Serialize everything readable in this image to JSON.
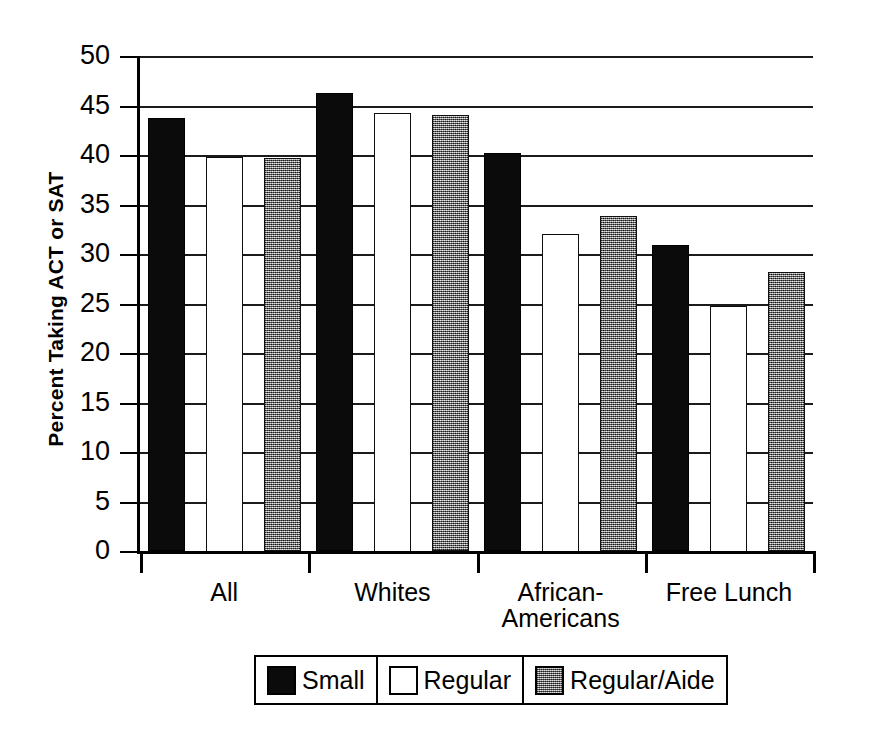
{
  "chart_data": {
    "type": "bar",
    "title": "",
    "xlabel": "",
    "ylabel": "Percent Taking ACT or SAT",
    "categories": [
      "All",
      "Whites",
      "African-Americans",
      "Free Lunch"
    ],
    "category_lines": [
      [
        "All"
      ],
      [
        "Whites"
      ],
      [
        "African-",
        "Americans"
      ],
      [
        "Free Lunch"
      ]
    ],
    "series": [
      {
        "name": "Small",
        "values": [
          43.7,
          46.3,
          40.2,
          30.9
        ]
      },
      {
        "name": "Regular",
        "values": [
          39.8,
          44.2,
          32.0,
          24.7
        ]
      },
      {
        "name": "Regular/Aide",
        "values": [
          39.7,
          44.0,
          33.8,
          28.2
        ]
      }
    ],
    "ylim": [
      0,
      50
    ],
    "ytick_values": [
      0,
      5,
      10,
      15,
      20,
      25,
      30,
      35,
      40,
      45,
      50
    ],
    "ytick_labels": [
      "0",
      "5",
      "10",
      "15",
      "20",
      "25",
      "30",
      "35",
      "40",
      "45",
      "50"
    ],
    "grid": true,
    "grid_axis": "y",
    "legend_position": "bottom-center",
    "colors": {
      "small": "#0b0b0b",
      "regular": "#ffffff",
      "aide": "#8f8f8f",
      "axis": "#000000",
      "grid": "#1b1b1b",
      "background": "#ffffff"
    }
  },
  "legend": {
    "entries": [
      {
        "label": "Small",
        "swatch": "solid-black-swatch"
      },
      {
        "label": "Regular",
        "swatch": "white-outline-swatch"
      },
      {
        "label": "Regular/Aide",
        "swatch": "hatched-gray-swatch"
      }
    ]
  }
}
